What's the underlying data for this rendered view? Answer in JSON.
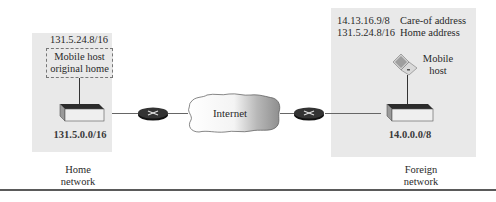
{
  "home_network": {
    "mobile_host_address": "131.5.24.8/16",
    "mobile_host_label_line1": "Mobile host",
    "mobile_host_label_line2": "original home",
    "network_address": "131.5.0.0/16",
    "caption_line1": "Home",
    "caption_line2": "network"
  },
  "internet": {
    "label": "Internet"
  },
  "foreign_network": {
    "care_of_address": "14.13.16.9/8",
    "care_of_label": "Care-of address",
    "home_address": "131.5.24.8/16",
    "home_address_label": "Home address",
    "mobile_host_label_line1": "Mobile",
    "mobile_host_label_line2": "host",
    "network_address": "14.0.0.0/8",
    "caption_line1": "Foreign",
    "caption_line2": "network"
  },
  "colors": {
    "panel_bg": "#e9e9e9",
    "router": "#1e1e1e",
    "line": "#555555"
  }
}
